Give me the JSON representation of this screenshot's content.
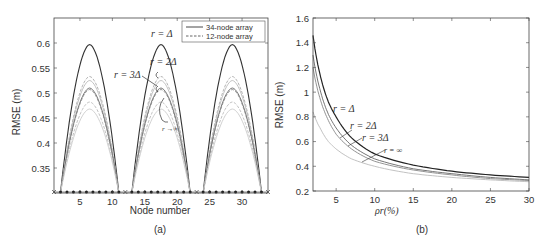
{
  "chart_data": [
    {
      "type": "line",
      "panel_label": "(a)",
      "xlabel": "Node number",
      "ylabel": "RMSE (m)",
      "xlim": [
        1,
        34
      ],
      "ylim": [
        0.3,
        0.65
      ],
      "xticks": [
        5,
        10,
        15,
        20,
        25,
        30
      ],
      "yticks": [
        0.35,
        0.4,
        0.45,
        0.5,
        0.55,
        0.6
      ],
      "grid": false,
      "legend_position": "upper right",
      "legend": [
        {
          "label": "34-node array",
          "style": "solid"
        },
        {
          "label": "12-node array",
          "style": "dashed"
        }
      ],
      "segments": [
        [
          2,
          11
        ],
        [
          13,
          22
        ],
        [
          24,
          33
        ]
      ],
      "series": [
        {
          "name": "34-node, r=Δ",
          "style": "solid",
          "color": "#333333",
          "peak": 0.597
        },
        {
          "name": "12-node, r=2Δ",
          "style": "dashed",
          "color": "#aaaaaa",
          "peak": 0.533
        },
        {
          "name": "34-node, r=2Δ",
          "style": "solid",
          "color": "#bbbbbb",
          "peak": 0.525
        },
        {
          "name": "34-node, r=3Δ",
          "style": "solid",
          "color": "#666666",
          "peak": 0.51
        },
        {
          "name": "12-node, r=3Δ",
          "style": "dashed",
          "color": "#888888",
          "peak": 0.507
        },
        {
          "name": "12-node, r→∞",
          "style": "dashed",
          "color": "#bbbbbb",
          "peak": 0.482
        },
        {
          "name": "34-node, r→∞",
          "style": "solid",
          "color": "#cccccc",
          "peak": 0.468
        }
      ],
      "anchor_markers": {
        "x_marks": [
          1,
          12,
          23,
          34
        ],
        "dots": "nodes between anchors at RMSE≈0.3"
      },
      "annotations": [
        "r=Δ",
        "r=2Δ",
        "r=3Δ",
        "r→∞"
      ]
    },
    {
      "type": "line",
      "panel_label": "(b)",
      "xlabel": "ρr(%)",
      "ylabel": "RMSE (m)",
      "xlim": [
        2,
        30
      ],
      "ylim": [
        0.2,
        1.6
      ],
      "xticks": [
        5,
        10,
        15,
        20,
        25,
        30
      ],
      "yticks": [
        0.2,
        0.4,
        0.6,
        0.8,
        1,
        1.2,
        1.4,
        1.6
      ],
      "grid": false,
      "x": [
        2,
        3,
        4,
        5,
        7,
        10,
        15,
        20,
        25,
        30
      ],
      "series": [
        {
          "name": "r=Δ",
          "color": "#222222",
          "values": [
            1.46,
            1.12,
            0.92,
            0.8,
            0.63,
            0.5,
            0.41,
            0.36,
            0.33,
            0.31
          ]
        },
        {
          "name": "r=2Δ",
          "color": "#666666",
          "values": [
            1.3,
            1.0,
            0.82,
            0.71,
            0.57,
            0.46,
            0.38,
            0.34,
            0.31,
            0.29
          ]
        },
        {
          "name": "r=3Δ",
          "color": "#888888",
          "values": [
            1.2,
            0.93,
            0.77,
            0.66,
            0.54,
            0.44,
            0.37,
            0.33,
            0.3,
            0.285
          ]
        },
        {
          "name": "r=∞",
          "color": "#bbbbbb",
          "values": [
            0.84,
            0.7,
            0.6,
            0.54,
            0.46,
            0.4,
            0.34,
            0.31,
            0.29,
            0.275
          ]
        }
      ],
      "annotations": [
        "r=Δ",
        "r=2Δ",
        "r=3Δ",
        "r=∞"
      ]
    }
  ],
  "panel_a": {
    "label": "(a)",
    "xlabel": "Node number",
    "ylabel": "RMSE (m)",
    "yticks": [
      "0.6",
      "0.55",
      "0.5",
      "0.45",
      "0.4",
      "0.35"
    ],
    "xticks": [
      "5",
      "10",
      "15",
      "20",
      "25",
      "30"
    ],
    "legend": {
      "solid": "34-node array",
      "dashed": "12-node array"
    },
    "ann_r1": "r = Δ",
    "ann_r2": "r = 2Δ",
    "ann_r3": "r = 3Δ",
    "ann_rinf": "r →∞"
  },
  "panel_b": {
    "label": "(b)",
    "xlabel": "ρr(%)",
    "ylabel": "RMSE (m)",
    "yticks": [
      "1.6",
      "1.4",
      "1.2",
      "1",
      "0.8",
      "0.6",
      "0.4",
      "0.2"
    ],
    "xticks": [
      "5",
      "10",
      "15",
      "20",
      "25",
      "30"
    ],
    "ann_r1": "r = Δ",
    "ann_r2": "r = 2Δ",
    "ann_r3": "r = 3Δ",
    "ann_rinf": "r = ∞"
  }
}
